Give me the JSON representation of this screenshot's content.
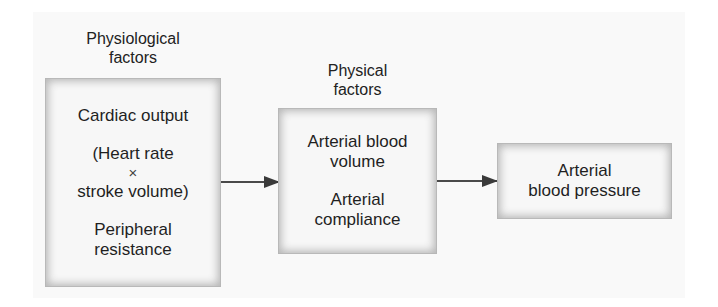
{
  "diagram": {
    "groups": [
      {
        "heading": [
          "Physiological",
          "factors"
        ],
        "box": {
          "lines": [
            "Cardiac output",
            "",
            "(Heart rate",
            "×",
            "stroke volume)",
            "",
            "Peripheral",
            "resistance"
          ]
        }
      },
      {
        "heading": [
          "Physical",
          "factors"
        ],
        "box": {
          "lines": [
            "Arterial blood",
            "volume",
            "",
            "Arterial",
            "compliance"
          ]
        }
      },
      {
        "heading": [],
        "box": {
          "lines": [
            "Arterial",
            "blood pressure"
          ]
        }
      }
    ],
    "edges": [
      {
        "from": "Physiological factors",
        "to": "Physical factors"
      },
      {
        "from": "Physical factors",
        "to": "Arterial blood pressure"
      }
    ],
    "colors": {
      "arrow": "#444444",
      "box_fill": "#f7f7f7",
      "box_shadow": "#b5b5b5",
      "text": "#1f1f1f"
    }
  }
}
